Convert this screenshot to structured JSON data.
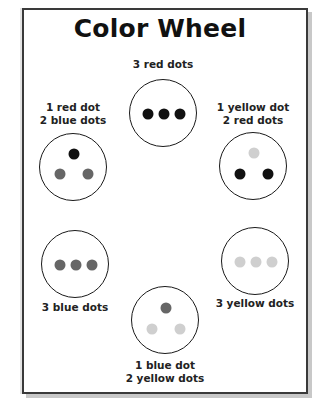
{
  "title": "Color Wheel",
  "colors": {
    "red": "#111111",
    "blue": "#666666",
    "yellow": "#cfcfcf",
    "outline": "#1a1a1a"
  },
  "wheel": [
    {
      "position": "top",
      "label_lines": [
        "3 red dots"
      ],
      "dots": [
        "red",
        "red",
        "red"
      ],
      "arrangement": "row"
    },
    {
      "position": "upper-right",
      "label_lines": [
        "1 yellow dot",
        "2 red dots"
      ],
      "dots": [
        "yellow",
        "red",
        "red"
      ],
      "arrangement": "triangle"
    },
    {
      "position": "lower-right",
      "label_lines": [
        "3 yellow dots"
      ],
      "dots": [
        "yellow",
        "yellow",
        "yellow"
      ],
      "arrangement": "row"
    },
    {
      "position": "bottom",
      "label_lines": [
        "1 blue dot",
        "2 yellow dots"
      ],
      "dots": [
        "blue",
        "yellow",
        "yellow"
      ],
      "arrangement": "triangle"
    },
    {
      "position": "lower-left",
      "label_lines": [
        "3 blue dots"
      ],
      "dots": [
        "blue",
        "blue",
        "blue"
      ],
      "arrangement": "row"
    },
    {
      "position": "upper-left",
      "label_lines": [
        "1 red dot",
        "2 blue dots"
      ],
      "dots": [
        "red",
        "blue",
        "blue"
      ],
      "arrangement": "triangle"
    }
  ]
}
